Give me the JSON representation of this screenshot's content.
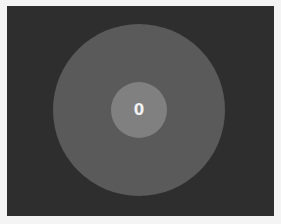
{
  "game": {
    "counter_value": "0",
    "colors": {
      "page_background": "#f4f4f4",
      "stage_background": "#2e2e2e",
      "outer_circle": "#5a5a5a",
      "inner_circle": "#808080",
      "counter_text": "#f2f2f2"
    }
  }
}
